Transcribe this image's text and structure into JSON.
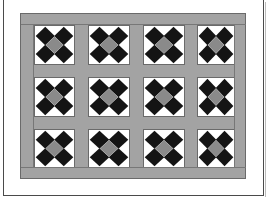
{
  "figure": {
    "colors": {
      "background": "#ffffff",
      "frame_line": "#4a4a4a",
      "sashing": "#a3a3a3",
      "sashing_edge": "#6a6a6a",
      "block_background": "#ffffff",
      "diamond_dark": "#141414",
      "diamond_center": "#8a8a8a"
    },
    "grid": {
      "columns": 4,
      "rows": 3
    },
    "block_pattern": {
      "type": "on-point diamonds",
      "corners": "dark",
      "center": "medium-gray",
      "background": "white"
    },
    "blocks": [
      {
        "row": 0,
        "col": 0
      },
      {
        "row": 0,
        "col": 1
      },
      {
        "row": 0,
        "col": 2
      },
      {
        "row": 0,
        "col": 3
      },
      {
        "row": 1,
        "col": 0
      },
      {
        "row": 1,
        "col": 1
      },
      {
        "row": 1,
        "col": 2
      },
      {
        "row": 1,
        "col": 3
      },
      {
        "row": 2,
        "col": 0
      },
      {
        "row": 2,
        "col": 1
      },
      {
        "row": 2,
        "col": 2
      },
      {
        "row": 2,
        "col": 3
      }
    ]
  }
}
